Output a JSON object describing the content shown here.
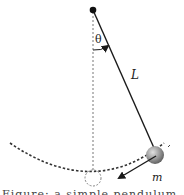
{
  "diagram": {
    "title": "Simple pendulum",
    "labels": {
      "angle": "θ",
      "length": "L",
      "mass": "m"
    },
    "elements": {
      "pivot": {
        "x": 93,
        "y": 10
      },
      "bob": {
        "x": 154,
        "y": 154
      },
      "equilibrium_position": {
        "x": 93,
        "y": 177
      }
    },
    "colors": {
      "line": "#1a1a1a",
      "dotted": "#777777",
      "bob_light": "#d8d8d8",
      "bob_dark": "#6a6a6a"
    },
    "caption_partial": "Figure: a simple pendulum of length L and mass m"
  }
}
